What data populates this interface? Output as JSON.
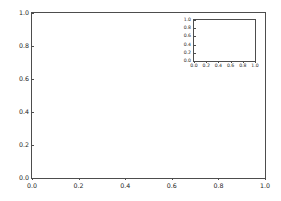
{
  "figure": {
    "background_color": "#ffffff",
    "spine_color": "#4d4d4d",
    "tick_label_color": "#262626",
    "width_px": 281,
    "height_px": 201
  },
  "chart_data": [
    {
      "type": "line",
      "name": "main-axes",
      "title": "",
      "xlabel": "",
      "ylabel": "",
      "xlim": [
        0.0,
        1.0
      ],
      "ylim": [
        0.0,
        1.0
      ],
      "xticks": [
        0.0,
        0.2,
        0.4,
        0.6,
        0.8,
        1.0
      ],
      "yticks": [
        0.0,
        0.2,
        0.4,
        0.6,
        0.8,
        1.0
      ],
      "xticklabels": [
        "0.0",
        "0.2",
        "0.4",
        "0.6",
        "0.8",
        "1.0"
      ],
      "yticklabels": [
        "0.0",
        "0.2",
        "0.4",
        "0.6",
        "0.8",
        "1.0"
      ],
      "grid": false,
      "legend": null,
      "series": [],
      "annotations": []
    },
    {
      "type": "line",
      "name": "inset-axes",
      "title": "",
      "xlabel": "",
      "ylabel": "",
      "xlim": [
        0.0,
        1.0
      ],
      "ylim": [
        0.0,
        1.0
      ],
      "xticks": [
        0.0,
        0.2,
        0.4,
        0.6,
        0.8,
        1.0
      ],
      "yticks": [
        0.0,
        0.2,
        0.4,
        0.6,
        0.8,
        1.0
      ],
      "xticklabels": [
        "0.0",
        "0.2",
        "0.4",
        "0.6",
        "0.8",
        "1.0"
      ],
      "yticklabels": [
        "0.0",
        "0.2",
        "0.4",
        "0.6",
        "0.8",
        "1.0"
      ],
      "grid": false,
      "legend": null,
      "series": [],
      "annotations": []
    }
  ]
}
